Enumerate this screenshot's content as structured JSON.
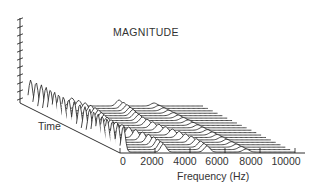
{
  "chart_data": {
    "type": "waterfall",
    "title": "MAGNITUDE",
    "xlabel": "Frequency (Hz)",
    "ylabel": "Time",
    "zlabel": "MAGNITUDE",
    "x_ticks": [
      0,
      2000,
      4000,
      6000,
      8000,
      10000
    ],
    "x_tick_labels": [
      "0",
      "2000",
      "4000",
      "6000",
      "8000",
      "10000"
    ],
    "xlim": [
      0,
      10000
    ],
    "num_traces": 20,
    "magnitude_axis_ticks": 11,
    "grid": false,
    "legend": "none",
    "peaks_per_trace": [
      {
        "freq": 150,
        "rel_mag": 1.0
      },
      {
        "freq": 2600,
        "rel_mag": 0.3
      },
      {
        "freq": 5000,
        "rel_mag": 0.22
      },
      {
        "freq": 7200,
        "rel_mag": 0.1
      }
    ]
  },
  "labels": {
    "title": "MAGNITUDE",
    "time": "Time",
    "frequency": "Frequency (Hz)"
  },
  "ticks": [
    {
      "label": "0",
      "x": 123
    },
    {
      "label": "2000",
      "x": 152
    },
    {
      "label": "4000",
      "x": 185
    },
    {
      "label": "6000",
      "x": 217
    },
    {
      "label": "8000",
      "x": 251
    },
    {
      "label": "10000",
      "x": 286
    }
  ],
  "colors": {
    "line": "#1a1a1a",
    "text": "#333333",
    "background": "#ffffff"
  }
}
